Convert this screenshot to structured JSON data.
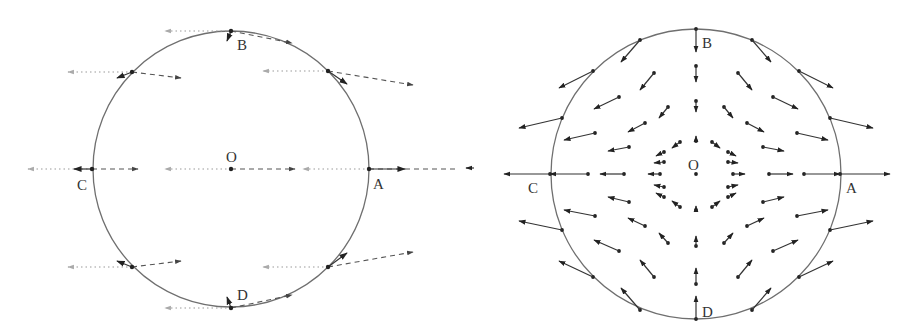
{
  "figure": {
    "left": {
      "title": "Left panel: uniform field decomposition on circle",
      "center": {
        "x": 231,
        "y": 169,
        "r": 138
      },
      "labels": [
        {
          "id": "B",
          "text": "B",
          "x": 237,
          "y": 50
        },
        {
          "id": "O",
          "text": "O",
          "x": 226,
          "y": 162
        },
        {
          "id": "C",
          "text": "C",
          "x": 77,
          "y": 190
        },
        {
          "id": "A",
          "text": "A",
          "x": 373,
          "y": 189
        },
        {
          "id": "D",
          "text": "D",
          "x": 237,
          "y": 300
        }
      ],
      "points": [
        {
          "x": 231,
          "y": 31
        },
        {
          "x": 132,
          "y": 72
        },
        {
          "x": 328,
          "y": 71
        },
        {
          "x": 92,
          "y": 169
        },
        {
          "x": 231,
          "y": 169
        },
        {
          "x": 369,
          "y": 169
        },
        {
          "x": 132,
          "y": 267
        },
        {
          "x": 328,
          "y": 267
        },
        {
          "x": 231,
          "y": 308
        }
      ],
      "dotted_arrows": [
        {
          "x1": 231,
          "y1": 31,
          "x2": 165,
          "y2": 31
        },
        {
          "x1": 132,
          "y1": 72,
          "x2": 68,
          "y2": 72
        },
        {
          "x1": 328,
          "y1": 71,
          "x2": 263,
          "y2": 71
        },
        {
          "x1": 92,
          "y1": 169,
          "x2": 28,
          "y2": 169
        },
        {
          "x1": 231,
          "y1": 169,
          "x2": 165,
          "y2": 169
        },
        {
          "x1": 369,
          "y1": 169,
          "x2": 303,
          "y2": 169
        },
        {
          "x1": 132,
          "y1": 267,
          "x2": 68,
          "y2": 267
        },
        {
          "x1": 328,
          "y1": 267,
          "x2": 263,
          "y2": 267
        },
        {
          "x1": 231,
          "y1": 308,
          "x2": 165,
          "y2": 308
        }
      ],
      "dashed_arrows": [
        {
          "x1": 231,
          "y1": 31,
          "x2": 292,
          "y2": 43
        },
        {
          "x1": 132,
          "y1": 72,
          "x2": 181,
          "y2": 78
        },
        {
          "x1": 328,
          "y1": 71,
          "x2": 413,
          "y2": 85
        },
        {
          "x1": 92,
          "y1": 169,
          "x2": 138,
          "y2": 169
        },
        {
          "x1": 231,
          "y1": 169,
          "x2": 295,
          "y2": 169
        },
        {
          "x1": 369,
          "y1": 169,
          "x2": 470,
          "y2": 169
        },
        {
          "x1": 132,
          "y1": 267,
          "x2": 181,
          "y2": 261
        },
        {
          "x1": 328,
          "y1": 267,
          "x2": 413,
          "y2": 252
        },
        {
          "x1": 231,
          "y1": 308,
          "x2": 292,
          "y2": 295
        }
      ],
      "solid_arrows": [
        {
          "x1": 231,
          "y1": 31,
          "x2": 227,
          "y2": 41
        },
        {
          "x1": 132,
          "y1": 72,
          "x2": 117,
          "y2": 78
        },
        {
          "x1": 328,
          "y1": 71,
          "x2": 347,
          "y2": 84
        },
        {
          "x1": 92,
          "y1": 169,
          "x2": 74,
          "y2": 169
        },
        {
          "x1": 369,
          "y1": 169,
          "x2": 405,
          "y2": 169
        },
        {
          "x1": 132,
          "y1": 267,
          "x2": 117,
          "y2": 261
        },
        {
          "x1": 328,
          "y1": 267,
          "x2": 347,
          "y2": 253
        },
        {
          "x1": 231,
          "y1": 308,
          "x2": 227,
          "y2": 297
        }
      ]
    },
    "right": {
      "title": "Right panel: saddle-type vector field in circle",
      "center": {
        "x": 238,
        "y": 174,
        "r": 145
      },
      "labels": [
        {
          "id": "B",
          "text": "B",
          "x": 244,
          "y": 48
        },
        {
          "id": "O",
          "text": "O",
          "x": 230,
          "y": 170
        },
        {
          "id": "C",
          "text": "C",
          "x": 70,
          "y": 193
        },
        {
          "id": "A",
          "text": "A",
          "x": 388,
          "y": 193
        },
        {
          "id": "D",
          "text": "D",
          "x": 244,
          "y": 317
        }
      ],
      "arrows": [
        {
          "x1": 238,
          "y1": 29,
          "x2": 238,
          "y2": 52
        },
        {
          "x1": 238,
          "y1": 66,
          "x2": 238,
          "y2": 82
        },
        {
          "x1": 238,
          "y1": 101,
          "x2": 238,
          "y2": 112
        },
        {
          "x1": 238,
          "y1": 141,
          "x2": 238,
          "y2": 136
        },
        {
          "x1": 238,
          "y1": 319,
          "x2": 238,
          "y2": 296
        },
        {
          "x1": 238,
          "y1": 284,
          "x2": 238,
          "y2": 268
        },
        {
          "x1": 238,
          "y1": 246,
          "x2": 238,
          "y2": 236
        },
        {
          "x1": 238,
          "y1": 210,
          "x2": 238,
          "y2": 206
        },
        {
          "x1": 238,
          "y1": 174,
          "x2": 238,
          "y2": 174
        },
        {
          "x1": 92,
          "y1": 174,
          "x2": 46,
          "y2": 174
        },
        {
          "x1": 130,
          "y1": 174,
          "x2": 92,
          "y2": 174
        },
        {
          "x1": 166,
          "y1": 174,
          "x2": 142,
          "y2": 174
        },
        {
          "x1": 202,
          "y1": 174,
          "x2": 190,
          "y2": 174
        },
        {
          "x1": 382,
          "y1": 174,
          "x2": 432,
          "y2": 174
        },
        {
          "x1": 346,
          "y1": 174,
          "x2": 382,
          "y2": 174
        },
        {
          "x1": 311,
          "y1": 174,
          "x2": 335,
          "y2": 174
        },
        {
          "x1": 275,
          "y1": 174,
          "x2": 287,
          "y2": 174
        },
        {
          "x1": 182,
          "y1": 40,
          "x2": 163,
          "y2": 62
        },
        {
          "x1": 294,
          "y1": 40,
          "x2": 313,
          "y2": 62
        },
        {
          "x1": 135,
          "y1": 71,
          "x2": 101,
          "y2": 88
        },
        {
          "x1": 341,
          "y1": 71,
          "x2": 375,
          "y2": 88
        },
        {
          "x1": 104,
          "y1": 118,
          "x2": 61,
          "y2": 128
        },
        {
          "x1": 372,
          "y1": 118,
          "x2": 415,
          "y2": 128
        },
        {
          "x1": 104,
          "y1": 230,
          "x2": 61,
          "y2": 221
        },
        {
          "x1": 372,
          "y1": 230,
          "x2": 415,
          "y2": 221
        },
        {
          "x1": 135,
          "y1": 277,
          "x2": 101,
          "y2": 261
        },
        {
          "x1": 341,
          "y1": 277,
          "x2": 375,
          "y2": 261
        },
        {
          "x1": 182,
          "y1": 310,
          "x2": 163,
          "y2": 288
        },
        {
          "x1": 294,
          "y1": 310,
          "x2": 313,
          "y2": 288
        },
        {
          "x1": 196,
          "y1": 73,
          "x2": 182,
          "y2": 90
        },
        {
          "x1": 280,
          "y1": 73,
          "x2": 294,
          "y2": 90
        },
        {
          "x1": 161,
          "y1": 97,
          "x2": 136,
          "y2": 109
        },
        {
          "x1": 315,
          "y1": 97,
          "x2": 340,
          "y2": 109
        },
        {
          "x1": 137,
          "y1": 133,
          "x2": 106,
          "y2": 140
        },
        {
          "x1": 339,
          "y1": 133,
          "x2": 370,
          "y2": 140
        },
        {
          "x1": 137,
          "y1": 216,
          "x2": 106,
          "y2": 210
        },
        {
          "x1": 339,
          "y1": 216,
          "x2": 370,
          "y2": 210
        },
        {
          "x1": 161,
          "y1": 251,
          "x2": 136,
          "y2": 240
        },
        {
          "x1": 315,
          "y1": 251,
          "x2": 340,
          "y2": 240
        },
        {
          "x1": 196,
          "y1": 277,
          "x2": 182,
          "y2": 260
        },
        {
          "x1": 280,
          "y1": 277,
          "x2": 294,
          "y2": 260
        },
        {
          "x1": 210,
          "y1": 107,
          "x2": 201,
          "y2": 118
        },
        {
          "x1": 266,
          "y1": 107,
          "x2": 275,
          "y2": 118
        },
        {
          "x1": 187,
          "y1": 123,
          "x2": 170,
          "y2": 132
        },
        {
          "x1": 289,
          "y1": 123,
          "x2": 306,
          "y2": 132
        },
        {
          "x1": 171,
          "y1": 147,
          "x2": 150,
          "y2": 151
        },
        {
          "x1": 305,
          "y1": 147,
          "x2": 326,
          "y2": 151
        },
        {
          "x1": 171,
          "y1": 202,
          "x2": 150,
          "y2": 197
        },
        {
          "x1": 305,
          "y1": 202,
          "x2": 326,
          "y2": 197
        },
        {
          "x1": 187,
          "y1": 226,
          "x2": 170,
          "y2": 218
        },
        {
          "x1": 289,
          "y1": 226,
          "x2": 306,
          "y2": 218
        },
        {
          "x1": 210,
          "y1": 243,
          "x2": 201,
          "y2": 233
        },
        {
          "x1": 266,
          "y1": 243,
          "x2": 275,
          "y2": 233
        },
        {
          "x1": 222,
          "y1": 142,
          "x2": 214,
          "y2": 148
        },
        {
          "x1": 254,
          "y1": 142,
          "x2": 262,
          "y2": 148
        },
        {
          "x1": 206,
          "y1": 152,
          "x2": 198,
          "y2": 156
        },
        {
          "x1": 270,
          "y1": 152,
          "x2": 278,
          "y2": 156
        },
        {
          "x1": 206,
          "y1": 162,
          "x2": 196,
          "y2": 163
        },
        {
          "x1": 270,
          "y1": 162,
          "x2": 280,
          "y2": 163
        },
        {
          "x1": 206,
          "y1": 187,
          "x2": 196,
          "y2": 185
        },
        {
          "x1": 270,
          "y1": 187,
          "x2": 280,
          "y2": 185
        },
        {
          "x1": 206,
          "y1": 197,
          "x2": 198,
          "y2": 193
        },
        {
          "x1": 270,
          "y1": 197,
          "x2": 278,
          "y2": 193
        },
        {
          "x1": 222,
          "y1": 207,
          "x2": 214,
          "y2": 201
        },
        {
          "x1": 254,
          "y1": 207,
          "x2": 262,
          "y2": 201
        }
      ],
      "extra_marks": [
        {
          "x1": 16,
          "y1": 168,
          "x2": 8,
          "y2": 168
        }
      ]
    }
  }
}
